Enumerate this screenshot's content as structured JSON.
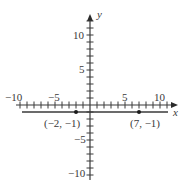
{
  "chart_data": {
    "type": "line",
    "title": "",
    "xlabel": "x",
    "ylabel": "y",
    "xlim": [
      -10,
      11
    ],
    "ylim": [
      -11,
      12
    ],
    "x_tick_labels": [
      "-10",
      "-5",
      "5",
      "10"
    ],
    "y_tick_labels": [
      "10",
      "5",
      "-5",
      "-10"
    ],
    "grid": false,
    "series": [
      {
        "name": "horizontal line y = -1",
        "x": [
          -10,
          11
        ],
        "y": [
          -1,
          -1
        ]
      }
    ],
    "points": [
      {
        "x": -2,
        "y": -1,
        "label": "(−2, −1)"
      },
      {
        "x": 7,
        "y": -1,
        "label": "(7, −1)"
      }
    ]
  },
  "labels": {
    "x_axis": "x",
    "y_axis": "y",
    "xt_neg10": "−10",
    "xt_neg5": "−5",
    "xt_5": "5",
    "xt_10": "10",
    "yt_10": "10",
    "yt_5": "5",
    "yt_neg5": "−5",
    "yt_neg10": "−10",
    "p1": "(−2, −1)",
    "p2": "(7, −1)"
  }
}
